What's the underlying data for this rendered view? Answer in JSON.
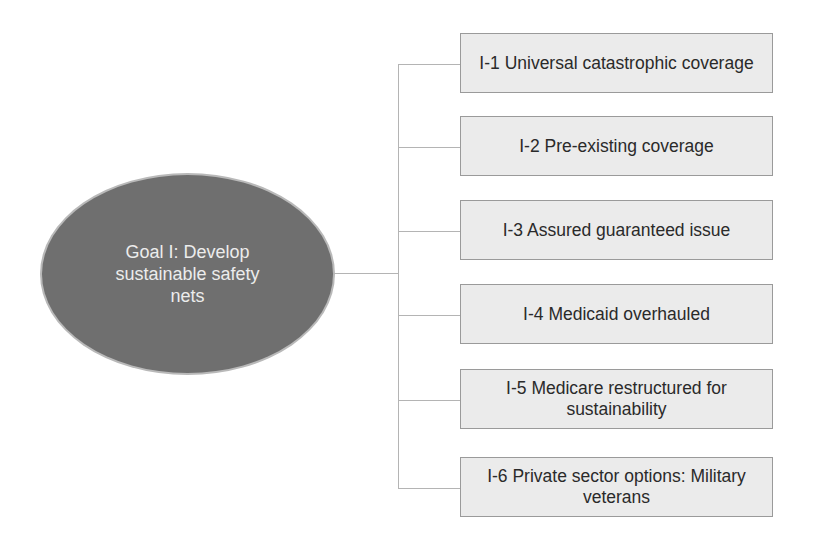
{
  "goal": {
    "label": "Goal I: Develop sustainable safety nets",
    "fill_color": "#6f6f6f",
    "text_color": "#ececec"
  },
  "objectives": [
    {
      "id": "I-1",
      "label": "I-1  Universal catastrophic coverage"
    },
    {
      "id": "I-2",
      "label": "I-2  Pre-existing coverage"
    },
    {
      "id": "I-3",
      "label": "I-3  Assured guaranteed issue"
    },
    {
      "id": "I-4",
      "label": "I-4  Medicaid overhauled"
    },
    {
      "id": "I-5",
      "label": "I-5  Medicare restructured for sustainability"
    },
    {
      "id": "I-6",
      "label": "I-6  Private sector options: Military veterans"
    }
  ],
  "colors": {
    "box_fill": "#ebebeb",
    "box_border": "#9a9a9a",
    "connector": "#b4b4b4"
  }
}
